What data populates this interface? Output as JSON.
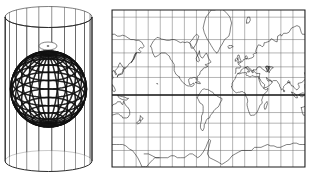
{
  "figure": {
    "title": "Cylindrical map projection",
    "background_color": "#ffffff",
    "ink_color": "#1a1a1a",
    "width": 312,
    "height": 179
  },
  "left_panel": {
    "name": "globe-in-cylinder-diagram",
    "description": "Wireframe globe inscribed in a transparent tangent cylinder",
    "cylinder": {
      "center_x": 48.5,
      "top_center_y": 17,
      "bottom_center_y": 161,
      "radius_x": 43.5,
      "radius_y": 10.5,
      "meridian_count": 22,
      "line_color": "#2a2a2a",
      "line_width": 0.6
    },
    "globe": {
      "center_x": 48.5,
      "center_y": 89,
      "radius": 38,
      "meridian_count": 24,
      "parallel_count": 13,
      "line_color": "#111111",
      "mesh_width": 1.5,
      "polar_cap": {
        "fill": "#ffffff",
        "center_x": 48,
        "center_y": 46,
        "rx": 9,
        "ry": 4
      }
    }
  },
  "right_panel": {
    "name": "mercator-world-map",
    "description": "Mercator projection world map with graticule",
    "frame": {
      "x": 8,
      "y": 10,
      "width": 193,
      "height": 157,
      "border_color": "#1a1a1a",
      "border_width": 1
    },
    "graticule": {
      "meridian_spacing_deg": 22.5,
      "meridian_count": 16,
      "parallel_labels": [
        80,
        70,
        60,
        45,
        30,
        0,
        -30,
        -45,
        -60,
        -70
      ],
      "line_color": "#6b6b6b",
      "line_width": 0.5,
      "equator_color": "#111111",
      "equator_width": 1.4,
      "equator_y": 88
    },
    "projection": {
      "type": "mercator",
      "center_longitude": -60,
      "lon_min": -240,
      "lon_max": 120,
      "lat_min": -78,
      "lat_max": 82
    },
    "coastline": {
      "color": "#1a1a1a",
      "line_width": 0.55
    },
    "features": [
      "Eurasia",
      "Africa",
      "North America",
      "South America",
      "Australia",
      "Antarctica",
      "Greenland",
      "Madagascar",
      "New Zealand",
      "Japan",
      "British Isles"
    ]
  },
  "chart_data": {
    "type": "map",
    "panels": [
      {
        "label": "globe-in-cylinder",
        "geometry": "sphere inscribed in tangent cylinder, graticule projected outward"
      },
      {
        "label": "mercator-map",
        "projection": "Mercator",
        "graticule_interval_deg": 22.5,
        "equator_highlighted": true
      }
    ]
  }
}
